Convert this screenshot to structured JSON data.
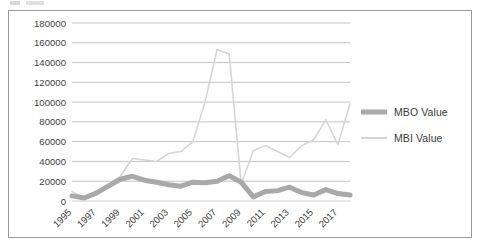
{
  "chart_data": {
    "type": "line",
    "title": "",
    "subtitle": "",
    "xlabel": "",
    "ylabel": "",
    "grid": true,
    "legend_position": "right",
    "ylim": [
      0,
      180000
    ],
    "ytick_step": 20000,
    "ytick_labels": [
      "0",
      "20000",
      "40000",
      "60000",
      "80000",
      "100000",
      "120000",
      "140000",
      "160000",
      "180000"
    ],
    "ytick_values": [
      0,
      20000,
      40000,
      60000,
      80000,
      100000,
      120000,
      140000,
      160000,
      180000
    ],
    "x": [
      1995,
      1996,
      1997,
      1998,
      1999,
      2000,
      2001,
      2002,
      2003,
      2004,
      2005,
      2006,
      2007,
      2008,
      2009,
      2010,
      2011,
      2012,
      2013,
      2014,
      2015,
      2016,
      2017,
      2018
    ],
    "xtick_labels": [
      "1995",
      "1997",
      "1999",
      "2001",
      "2003",
      "2005",
      "2007",
      "2009",
      "2011",
      "2013",
      "2015",
      "2017"
    ],
    "xtick_values": [
      1995,
      1997,
      1999,
      2001,
      2003,
      2005,
      2007,
      2009,
      2011,
      2013,
      2015,
      2017
    ],
    "xtick_rotation_deg": 45,
    "series": [
      {
        "name": "MBO Value",
        "color": "#a9a9a9",
        "line_width": 5,
        "values": [
          5200,
          3000,
          8000,
          15000,
          22000,
          25000,
          21000,
          19000,
          16500,
          15000,
          19000,
          18500,
          20000,
          25500,
          19000,
          4200,
          9500,
          10500,
          14000,
          8500,
          6000,
          11500,
          7500,
          6000
        ]
      },
      {
        "name": "MBI Value",
        "color": "#d6d6d6",
        "line_width": 1.6,
        "values": [
          9500,
          3000,
          8500,
          16000,
          25000,
          43000,
          41500,
          40000,
          48000,
          50000,
          60000,
          100000,
          153000,
          149000,
          17000,
          51000,
          56000,
          50000,
          44000,
          56000,
          62000,
          82000,
          57000,
          98000
        ]
      }
    ]
  },
  "legend": {
    "items": [
      {
        "label": "MBO Value",
        "color": "#a9a9a9",
        "style": "thick"
      },
      {
        "label": "MBI Value",
        "color": "#d6d6d6",
        "style": "thin"
      }
    ]
  }
}
